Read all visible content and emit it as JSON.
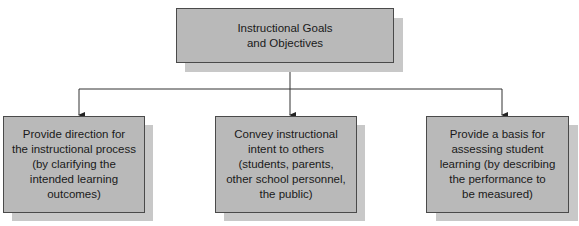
{
  "diagram": {
    "root": {
      "label": "Instructional Goals\nand Objectives"
    },
    "children": [
      {
        "label": "Provide direction for\nthe instructional process\n(by clarifying the\nintended learning\noutcomes)"
      },
      {
        "label": "Convey instructional\nintent to others\n(students, parents,\nother school personnel,\nthe public)"
      },
      {
        "label": "Provide a basis for\nassessing student\nlearning (by describing\nthe performance to\nbe measured)"
      }
    ],
    "edges": [
      {
        "from": "root",
        "to": "children.0"
      },
      {
        "from": "root",
        "to": "children.1"
      },
      {
        "from": "root",
        "to": "children.2"
      }
    ],
    "colors": {
      "box_fill": "#b9b9b9",
      "box_border": "#4a4a4a",
      "shadow": "#c8c8c8",
      "line": "#333333"
    }
  }
}
